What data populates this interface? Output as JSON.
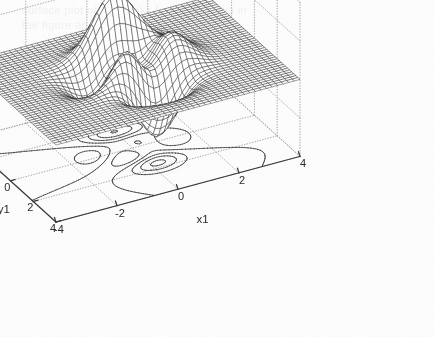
{
  "figure": {
    "background_color": "#fdfdfd",
    "mesh_color": "#1d1d1d",
    "axis_color": "#3a3a3a",
    "grid_color": "#9a9a9a",
    "contour_color": "#2b2b2b"
  },
  "axes": {
    "z": {
      "label": "f(x1,x2)",
      "ticks": [
        "10",
        "5",
        "0",
        "-5",
        "-10"
      ],
      "range": [
        -10,
        10
      ]
    },
    "y": {
      "label": "y1",
      "ticks": [
        "4",
        "2",
        "0",
        "-2",
        "-4"
      ],
      "range": [
        -4,
        4
      ]
    },
    "x": {
      "label": "x1",
      "ticks": [
        "-4",
        "-2",
        "0",
        "2",
        "4"
      ],
      "range": [
        -4,
        4
      ]
    }
  },
  "scan_ghost": {
    "lines": [
      "surface plot of the peaks function shown in",
      "the figure above with contour projection"
    ]
  },
  "chart_data": {
    "type": "surface",
    "title": "",
    "xlabel": "x1",
    "ylabel": "y1",
    "zlabel": "f(x1,x2)",
    "xlim": [
      -4,
      4
    ],
    "ylim": [
      -4,
      4
    ],
    "zlim": [
      -10,
      10
    ],
    "xticks": [
      -4,
      -2,
      0,
      2,
      4
    ],
    "yticks": [
      -4,
      -2,
      0,
      2,
      4
    ],
    "zticks": [
      -10,
      -5,
      0,
      5,
      10
    ],
    "grid": true,
    "legend": null,
    "style": "mesh wireframe with contour projection on floor plane",
    "function": "peaks",
    "formula": "3*(1-x)^2*exp(-x^2-(y+1)^2) - 10*(x/5 - x^3 - y^5)*exp(-x^2-y^2) - (1/3)*exp(-(x+1)^2 - y^2)",
    "grid_resolution": 49,
    "features": [
      {
        "name": "primary peak",
        "x": -0.01,
        "y": 1.58,
        "z": 8.1
      },
      {
        "name": "secondary peak",
        "x": -1.35,
        "y": 0.2,
        "z": 3.8
      },
      {
        "name": "deep valley",
        "x": 0.23,
        "y": -1.63,
        "z": -6.5
      },
      {
        "name": "shallow dip",
        "x": -1.3,
        "y": -0.6,
        "z": -1.0
      }
    ],
    "contour_levels": [
      -6,
      -4,
      -2,
      0,
      2,
      4,
      6,
      8
    ],
    "contour_plane_z": -10,
    "view": {
      "azimuth": -37.5,
      "elevation": 30
    }
  }
}
